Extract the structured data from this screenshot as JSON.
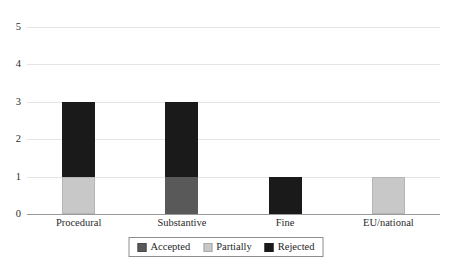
{
  "chart_data": {
    "type": "bar",
    "subtype": "stacked-column",
    "title": "",
    "xlabel": "",
    "ylabel": "",
    "categories": [
      "Procedural",
      "Substantive",
      "Fine",
      "EU/national"
    ],
    "series": [
      {
        "name": "Accepted",
        "color": "#595959",
        "values": [
          0,
          1,
          0,
          0
        ]
      },
      {
        "name": "Partially",
        "color": "#c8c8c8",
        "values": [
          1,
          0,
          0,
          1
        ]
      },
      {
        "name": "Rejected",
        "color": "#1a1a1a",
        "values": [
          2,
          2,
          1,
          0
        ]
      }
    ],
    "totals": [
      3,
      3,
      1,
      1
    ],
    "ylim": [
      0,
      5
    ],
    "yticks": [
      0,
      1,
      2,
      3,
      4,
      5
    ],
    "ytick_labels": [
      "0",
      "1",
      "2",
      "3",
      "4",
      "5"
    ],
    "grid": true,
    "grid_axis": "y",
    "legend": true,
    "legend_position": "bottom-center",
    "background": "#ffffff",
    "gridline_color": "#e4e4e4",
    "axis_color": "#9a9a9a"
  },
  "axes": {
    "y": {
      "ticks": [
        {
          "value": 5,
          "label": "5"
        },
        {
          "value": 4,
          "label": "4"
        },
        {
          "value": 3,
          "label": "3"
        },
        {
          "value": 2,
          "label": "2"
        },
        {
          "value": 1,
          "label": "1"
        },
        {
          "value": 0,
          "label": "0"
        }
      ]
    },
    "x": {
      "ticks": [
        {
          "label": "Procedural"
        },
        {
          "label": "Substantive"
        },
        {
          "label": "Fine"
        },
        {
          "label": "EU/national"
        }
      ]
    }
  },
  "legend": {
    "items": [
      {
        "label": "Accepted",
        "color": "#595959"
      },
      {
        "label": "Partially",
        "color": "#c8c8c8"
      },
      {
        "label": "Rejected",
        "color": "#1a1a1a"
      }
    ]
  },
  "title": {
    "text": ""
  }
}
